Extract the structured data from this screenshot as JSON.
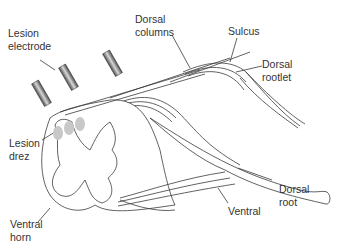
{
  "figure": {
    "type": "anatomical-diagram",
    "colors": {
      "line": "#3a3a3a",
      "lesion": "#c8c8c8",
      "electrode_dark": "#4a4a4a",
      "electrode_light": "#d8d8d8",
      "background": "#ffffff"
    }
  },
  "labels": {
    "lesion_electrode": {
      "line1": "Lesion",
      "line2": "electrode"
    },
    "dorsal_columns": {
      "line1": "Dorsal",
      "line2": "columns"
    },
    "sulcus": {
      "line1": "Sulcus"
    },
    "dorsal_rootlet": {
      "line1": "Dorsal",
      "line2": "rootlet"
    },
    "lesion_drez": {
      "line1": "Lesion",
      "line2": "drez"
    },
    "dorsal_root": {
      "line1": "Dorsal",
      "line2": "root"
    },
    "ventral": {
      "line1": "Ventral"
    },
    "ventral_horn": {
      "line1": "Ventral",
      "line2": "horn"
    }
  }
}
